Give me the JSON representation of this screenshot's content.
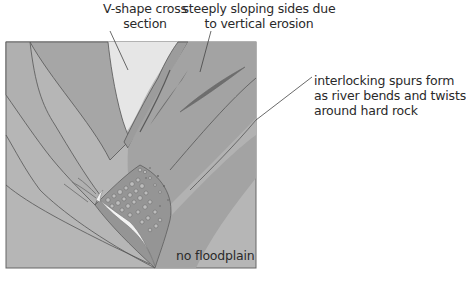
{
  "diagram": {
    "labels": {
      "v_shape": [
        "V-shape cross",
        "section"
      ],
      "steep_sides": [
        "steeply sloping sides due",
        "to vertical erosion"
      ],
      "spurs": [
        "interlocking spurs form",
        "as river bends and twists",
        "around hard rock"
      ],
      "no_floodplain": "no floodplain"
    },
    "colors": {
      "box_fill": "#b4b4b4",
      "spur_left": "#a9a9a9",
      "spur_dark": "#9a9a9a",
      "sky": "#e8e8e8",
      "outline": "#555555",
      "river": "#f2f2f2"
    }
  }
}
